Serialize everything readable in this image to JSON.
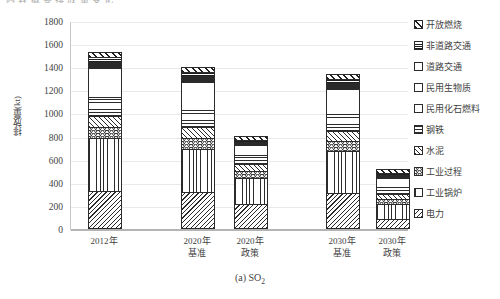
{
  "top_title": "内 容 概 要   排 放 量 变 化",
  "caption_main": "(a) SO",
  "caption_sub": "2",
  "axes": {
    "ylabel": "排放量(kt)",
    "yticks": [
      "1800",
      "1600",
      "1400",
      "1200",
      "1000",
      "800",
      "600",
      "400",
      "200",
      "0"
    ],
    "ymin": 0,
    "ymax": 1800,
    "grid": true
  },
  "legend": {
    "position": "right",
    "items": [
      {
        "label": "开放燃烧",
        "pattern": "p-open"
      },
      {
        "label": "非道路交通",
        "pattern": "p-nonroad"
      },
      {
        "label": "道路交通",
        "pattern": "p-road"
      },
      {
        "label": "民用生物质",
        "pattern": "p-bio"
      },
      {
        "label": "民用化石燃料",
        "pattern": "p-fossil"
      },
      {
        "label": "钢铁",
        "pattern": "p-steel"
      },
      {
        "label": "水泥",
        "pattern": "p-cement"
      },
      {
        "label": "工业过程",
        "pattern": "p-proc"
      },
      {
        "label": "工业锅炉",
        "pattern": "p-boiler"
      },
      {
        "label": "电力",
        "pattern": "p-power"
      }
    ]
  },
  "chart_data": {
    "type": "bar",
    "subtype": "stacked",
    "title": "(a) SO2",
    "xlabel": "",
    "ylabel": "排放量(kt)",
    "ylim": [
      0,
      1800
    ],
    "yticks": [
      0,
      200,
      400,
      600,
      800,
      1000,
      1200,
      1400,
      1600,
      1800
    ],
    "categories": [
      "2012年",
      "2020年\n基准",
      "2020年\n政策",
      "2030年\n基准",
      "2030年\n政策"
    ],
    "category_lines": [
      [
        "2012年",
        ""
      ],
      [
        "2020年",
        "基准"
      ],
      [
        "2020年",
        "政策"
      ],
      [
        "2030年",
        "基准"
      ],
      [
        "2030年",
        "政策"
      ]
    ],
    "series": [
      {
        "name": "电力",
        "pattern": "p-power",
        "values": [
          330,
          320,
          215,
          310,
          85
        ]
      },
      {
        "name": "工业锅炉",
        "pattern": "p-boiler",
        "values": [
          455,
          375,
          225,
          365,
          135
        ]
      },
      {
        "name": "工业过程",
        "pattern": "p-proc",
        "values": [
          95,
          90,
          60,
          85,
          40
        ]
      },
      {
        "name": "水泥",
        "pattern": "p-cement",
        "values": [
          100,
          95,
          65,
          90,
          45
        ]
      },
      {
        "name": "钢铁",
        "pattern": "p-steel",
        "values": [
          165,
          150,
          80,
          145,
          60
        ]
      },
      {
        "name": "民用化石燃料",
        "pattern": "p-fossil",
        "values": [
          245,
          240,
          85,
          215,
          80
        ]
      },
      {
        "name": "民用生物质",
        "pattern": "p-bio",
        "values": [
          0,
          0,
          0,
          0,
          0
        ]
      },
      {
        "name": "道路交通",
        "pattern": "p-road",
        "values": [
          60,
          55,
          25,
          50,
          25
        ]
      },
      {
        "name": "非道路交通",
        "pattern": "p-nonroad",
        "values": [
          40,
          35,
          15,
          35,
          15
        ]
      },
      {
        "name": "开放燃烧",
        "pattern": "p-open",
        "values": [
          45,
          45,
          35,
          45,
          35
        ]
      }
    ],
    "totals": [
      1535,
      1405,
      805,
      1340,
      520
    ]
  }
}
